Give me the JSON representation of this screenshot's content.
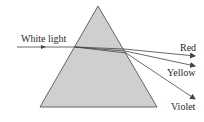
{
  "diagram": {
    "labels": {
      "incident": "White light",
      "red": "Red",
      "yellow": "Yellow",
      "violet": "Violet"
    },
    "colors": {
      "prism_fill": "#cfcfcf",
      "prism_stroke": "#555555",
      "ray": "#444444",
      "text": "#2a2a2a"
    }
  }
}
